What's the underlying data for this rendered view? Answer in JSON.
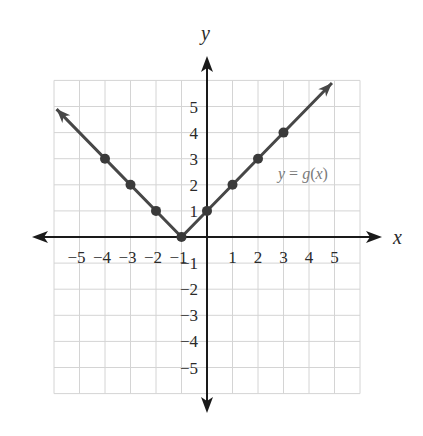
{
  "chart_data": {
    "type": "line",
    "title": "",
    "function_label": "y = g(x)",
    "xlabel": "x",
    "ylabel": "y",
    "xlim": [
      -6,
      6
    ],
    "ylim": [
      -6,
      6
    ],
    "grid": true,
    "x_ticks": [
      -5,
      -4,
      -3,
      -2,
      -1,
      1,
      2,
      3,
      4,
      5
    ],
    "y_ticks": [
      5,
      4,
      3,
      2,
      1,
      -1,
      -2,
      -3,
      -4,
      -5
    ],
    "x_tick_labels": [
      "−5",
      "−4",
      "−3",
      "−2",
      "−1",
      "1",
      "2",
      "3",
      "4",
      "5"
    ],
    "y_tick_labels": [
      "5",
      "4",
      "3",
      "2",
      "1",
      "−1",
      "−2",
      "−3",
      "−4",
      "−5"
    ],
    "series": [
      {
        "name": "y = g(x)",
        "points": [
          [
            -4,
            3
          ],
          [
            -3,
            2
          ],
          [
            -2,
            1
          ],
          [
            -1,
            0
          ],
          [
            0,
            1
          ],
          [
            1,
            2
          ],
          [
            2,
            3
          ],
          [
            3,
            4
          ]
        ],
        "line_start": [
          -5.9,
          4.9
        ],
        "line_end": [
          4.9,
          5.9
        ],
        "arrows_both_ends": true,
        "vertex": [
          -1,
          0
        ]
      }
    ]
  },
  "colors": {
    "grid": "#d4d4d4",
    "axis": "#1a1a1a",
    "line": "#474747",
    "point": "#3a3a3a",
    "label_gray": "#7a7a7a"
  }
}
